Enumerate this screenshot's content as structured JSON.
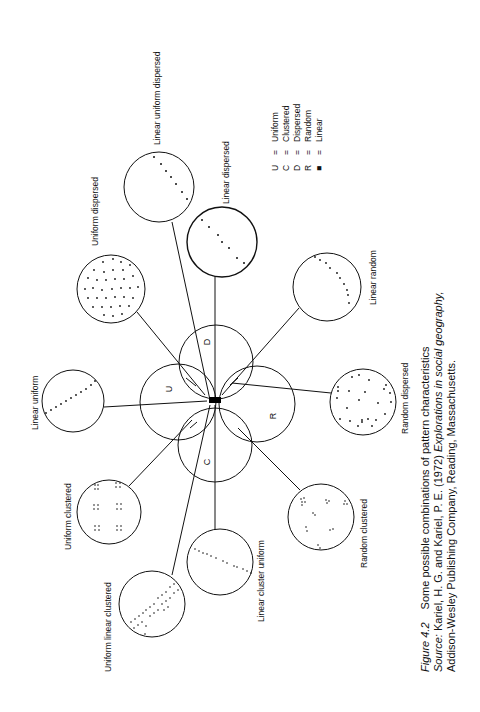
{
  "figure": {
    "orientation": "rotated-90-ccw",
    "hub": {
      "center": [
        214,
        401
      ],
      "circles": [
        {
          "letter": "U",
          "meaning": "Uniform",
          "cx": 178,
          "cy": 402,
          "r": 38
        },
        {
          "letter": "D",
          "meaning": "Dispersed",
          "cx": 216,
          "cy": 362,
          "r": 37
        },
        {
          "letter": "R",
          "meaning": "Random",
          "cx": 257,
          "cy": 404,
          "r": 38
        },
        {
          "letter": "C",
          "meaning": "Clustered",
          "cx": 215,
          "cy": 445,
          "r": 37
        }
      ],
      "linear_marker": "black-rectangle"
    },
    "patterns": [
      {
        "label": "Linear uniform dispersed",
        "cx": 159,
        "cy": 187,
        "r": 35,
        "pattern": "linear-dispersed-dots",
        "label_x": 160,
        "label_y": 145
      },
      {
        "label": "Linear dispersed",
        "cx": 222,
        "cy": 242,
        "r": 35,
        "pattern": "linear-dispersed-dots-2",
        "label_x": 226,
        "label_y": 204
      },
      {
        "label": "Uniform dispersed",
        "cx": 111,
        "cy": 289,
        "r": 34,
        "pattern": "uniform-grid",
        "label_x": 96,
        "label_y": 238
      },
      {
        "label": "Linear random",
        "cx": 327,
        "cy": 287,
        "r": 34,
        "pattern": "linear-random-arc",
        "label_x": 375,
        "label_y": 290
      },
      {
        "label": "Linear uniform",
        "cx": 73,
        "cy": 401,
        "r": 31,
        "pattern": "linear-uniform-dots",
        "label_x": 38,
        "label_y": 410
      },
      {
        "label": "Random dispersed",
        "cx": 363,
        "cy": 402,
        "r": 33,
        "pattern": "random-scatter",
        "label_x": 405,
        "label_y": 400
      },
      {
        "label": "Uniform clustered",
        "cx": 109,
        "cy": 512,
        "r": 32,
        "pattern": "uniform-clusters",
        "label_x": 70,
        "label_y": 510
      },
      {
        "label": "Random clustered",
        "cx": 321,
        "cy": 517,
        "r": 33,
        "pattern": "random-clusters",
        "label_x": 365,
        "label_y": 527
      },
      {
        "label": "Linear cluster uniform",
        "cx": 220,
        "cy": 562,
        "r": 33,
        "pattern": "linear-clusters",
        "label_x": 262,
        "label_y": 570
      },
      {
        "label": "Uniform linear clustered",
        "cx": 152,
        "cy": 604,
        "r": 33,
        "pattern": "uniform-linear-clusters",
        "label_x": 109,
        "label_y": 600
      }
    ]
  },
  "legend": {
    "items": [
      {
        "symbol": "U",
        "eq": "=",
        "text": "Uniform"
      },
      {
        "symbol": "C",
        "eq": "=",
        "text": "Clustered"
      },
      {
        "symbol": "D",
        "eq": "=",
        "text": "Dispersed"
      },
      {
        "symbol": "R",
        "eq": "=",
        "text": "Random"
      },
      {
        "symbol": "■",
        "eq": "=",
        "text": "Linear"
      }
    ]
  },
  "caption": {
    "figure_label": "Figure 4.2",
    "title": "Some possible combinations of pattern characteristics",
    "source_prefix": "Source: ",
    "source_authors": "Kariel, H. G. and Kariel, P. E. (1972) ",
    "source_title": "Explorations in social geography,",
    "source_publisher": "Addison-Wesley Publishing Company, Reading, Massachusetts."
  }
}
